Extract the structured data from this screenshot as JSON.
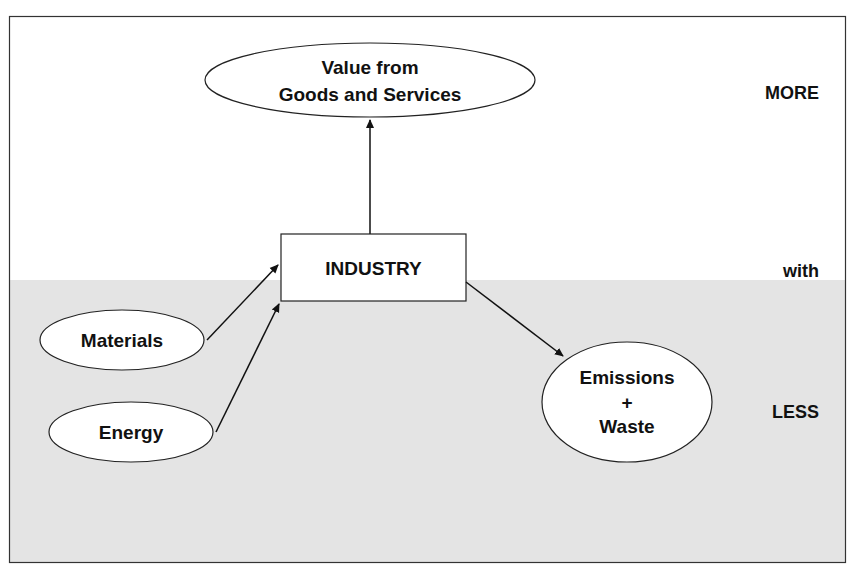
{
  "diagram": {
    "top_node": {
      "line1": "Value from",
      "line2": "Goods and Services"
    },
    "center_node": {
      "label": "INDUSTRY"
    },
    "inputs": [
      {
        "label": "Materials"
      },
      {
        "label": "Energy"
      }
    ],
    "output_node": {
      "line1": "Emissions",
      "line2": "+",
      "line3": "Waste"
    },
    "side_labels": {
      "more": "MORE",
      "with": "with",
      "less": "LESS"
    }
  },
  "colors": {
    "background": "#ffffff",
    "shaded_region": "#e4e4e4",
    "stroke": "#222222",
    "text": "#111111"
  }
}
